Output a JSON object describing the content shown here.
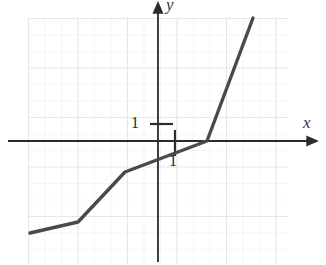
{
  "figure": {
    "type": "cartesian-graph",
    "axis_labels": {
      "x": "x",
      "y": "y"
    },
    "tick_labels": {
      "y_unit": "1",
      "x_unit": "1"
    },
    "colors": {
      "curve": "#4a4a4a",
      "axis": "#2b2b2b",
      "grid_minor": "#e9e9ec",
      "grid_major": "#dcdce2",
      "text": "#2b2b2b"
    }
  },
  "chart_data": {
    "type": "line",
    "title": "",
    "xlabel": "x",
    "ylabel": "y",
    "grid": true,
    "legend": null,
    "unit_px": 16.5,
    "origin_px": {
      "x": 158,
      "y": 141
    },
    "xlim": [
      -7.8,
      7.9
    ],
    "ylim": [
      -7.5,
      7.5
    ],
    "series": [
      {
        "name": "piecewise-linear curve",
        "points_px": [
          {
            "x": 30,
            "y": 233
          },
          {
            "x": 78,
            "y": 222
          },
          {
            "x": 125,
            "y": 172
          },
          {
            "x": 207,
            "y": 141
          },
          {
            "x": 253,
            "y": 18
          }
        ],
        "points_data": [
          {
            "x": -7.76,
            "y": -5.58
          },
          {
            "x": -4.85,
            "y": -4.91
          },
          {
            "x": -2.0,
            "y": -1.88
          },
          {
            "x": 2.97,
            "y": 0.0
          },
          {
            "x": 5.76,
            "y": 7.45
          }
        ]
      }
    ],
    "ticks": [
      {
        "axis": "y",
        "value": 1,
        "label": "1",
        "px": {
          "x": 158,
          "y": 124
        }
      },
      {
        "axis": "x",
        "value": 1,
        "label": "1",
        "px": {
          "x": 175,
          "y": 141
        }
      }
    ],
    "grid_box_px": {
      "left": 28,
      "top": 18,
      "right": 288,
      "bottom": 264,
      "step": 16.5
    }
  }
}
